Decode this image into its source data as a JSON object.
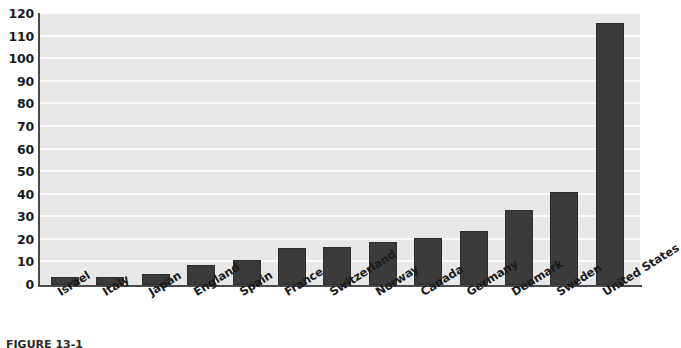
{
  "chart_data": {
    "type": "bar",
    "title": "",
    "subtitle": "",
    "xlabel": "",
    "ylabel": "",
    "categories": [
      "Israel",
      "Italy",
      "Japan",
      "England",
      "Spain",
      "France",
      "Switzerland",
      "Norway",
      "Canada",
      "Germany",
      "Denmark",
      "Sweden",
      "United States"
    ],
    "values": [
      3.5,
      3.5,
      5,
      9,
      11,
      16.5,
      17,
      19,
      21,
      24,
      33,
      41,
      116
    ],
    "ylim": [
      0,
      120
    ],
    "ytick_values": [
      0,
      10,
      20,
      30,
      40,
      50,
      60,
      70,
      80,
      90,
      100,
      110,
      120
    ],
    "ytick_labels": [
      "0",
      "10",
      "20",
      "30",
      "40",
      "50",
      "60",
      "70",
      "80",
      "90",
      "100",
      "110",
      "120"
    ],
    "grid": true,
    "grid_orientation": "horizontal",
    "legend": false,
    "legend_position": "none",
    "bar_color": "#3b3b3b",
    "plot_background_color": "#e8e8e8",
    "gridline_color": "#fbfbfb",
    "axis_color": "#4a4a4a",
    "xtick_label_rotation_degrees": -32
  },
  "caption": {
    "text": "FIGURE 13-1"
  }
}
